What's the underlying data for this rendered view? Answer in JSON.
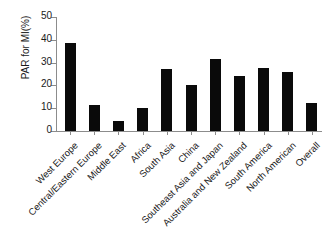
{
  "chart_data": {
    "type": "bar",
    "title": "",
    "xlabel": "",
    "ylabel": "PAR for MI(%)",
    "ylim": [
      0,
      50
    ],
    "yticks": [
      "0",
      "10",
      "20",
      "30",
      "40",
      "50"
    ],
    "grid": false,
    "legend": false,
    "bar_color": "#0a0a0a",
    "axis_color": "#8c8c8c",
    "categories": [
      "West Europe",
      "Central/Eastern Europe",
      "Middle East",
      "Africa",
      "South Asia",
      "China",
      "Southeast Asia and Japan",
      "Australia and New Zealand",
      "South America",
      "North American",
      "Overall"
    ],
    "values": [
      38.6,
      11.3,
      4.3,
      10.2,
      27.3,
      20.4,
      31.5,
      24.1,
      27.8,
      25.9,
      12.4
    ]
  }
}
